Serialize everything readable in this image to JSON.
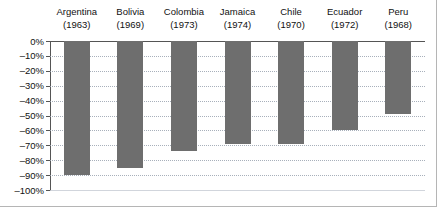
{
  "chart_data": {
    "type": "bar",
    "title": "",
    "subtitle": "",
    "xlabel": "",
    "ylabel": "",
    "categories": [
      "Argentina",
      "Bolivia",
      "Colombia",
      "Jamaica",
      "Chile",
      "Ecuador",
      "Peru"
    ],
    "category_years": [
      "(1963)",
      "(1969)",
      "(1973)",
      "(1974)",
      "(1970)",
      "(1972)",
      "(1968)"
    ],
    "values": [
      -90,
      -85,
      -74,
      -69,
      -69,
      -60,
      -49
    ],
    "value_labels": [
      "-90%",
      "-85%",
      "-74%",
      "-69%",
      "-69%",
      "-60%",
      "-49%"
    ],
    "ylim": [
      -100,
      0
    ],
    "ytick_values": [
      0,
      -10,
      -20,
      -30,
      -40,
      -50,
      -60,
      -70,
      -80,
      -90,
      -100
    ],
    "ytick_labels": [
      "0%",
      "–10%",
      "–20%",
      "–30%",
      "–40%",
      "–50%",
      "–60%",
      "–70%",
      "–80%",
      "–90%",
      "–100%"
    ],
    "grid": true,
    "grid_style": "dotted",
    "legend": false,
    "legend_position": "none",
    "bar_color": "#6e6e6e",
    "axis_color": "#555555",
    "grid_color": "#9aa3b0",
    "frame_color": "#b5b5b5",
    "background": "#ffffff",
    "annotations": []
  }
}
